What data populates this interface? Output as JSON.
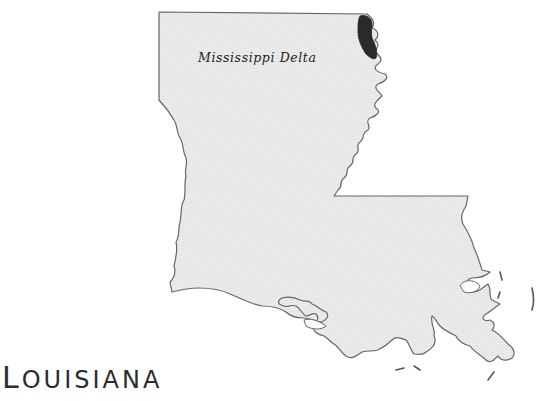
{
  "map": {
    "state_name": "Louisiana",
    "state_title_first": "L",
    "state_title_rest": "OUISIANA",
    "region_label": "Mississippi Delta",
    "colors": {
      "state_fill": "#e8e8e8",
      "state_stroke": "#666666",
      "delta_region": "#2a2a2a",
      "background": "#ffffff"
    }
  }
}
